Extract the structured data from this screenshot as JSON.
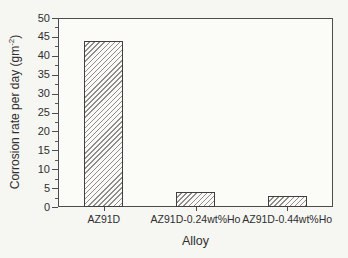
{
  "figure": {
    "background_color": "#f6f6f3",
    "plot_background_color": "#fbfbf8",
    "axis_color": "#4d4d4d",
    "text_color": "#2f2f2f",
    "hatch_color": "#8d8d8d",
    "bar_fill_color": "#faf9f6"
  },
  "chart_data": {
    "type": "bar",
    "title": "",
    "xlabel": "Alloy",
    "ylabel": "Corrosion rate per day (gm⁻²)",
    "ylabel_parts": {
      "prefix": "Corrosion rate per day (gm",
      "sup": "-2",
      "suffix": ")"
    },
    "categories": [
      "AZ91D",
      "AZ91D-0.24wt%Ho",
      "AZ91D-0.44wt%Ho"
    ],
    "values": [
      44,
      4,
      3
    ],
    "ylim": [
      0,
      50
    ],
    "yticks": [
      0,
      5,
      10,
      15,
      20,
      25,
      30,
      35,
      40,
      45,
      50
    ],
    "ytick_minor_step": 2.5,
    "bar_hatch": "diagonal-forward-slash",
    "grid": false,
    "legend": "none",
    "frame": "full-box"
  }
}
